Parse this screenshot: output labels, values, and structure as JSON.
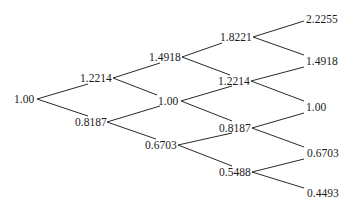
{
  "diagram": {
    "type": "binomial-tree",
    "steps": 4,
    "line_color": "#2a2a2a",
    "text_color": "#1a1a1a",
    "levels": [
      {
        "step": 0,
        "nodes": [
          {
            "id": "n0_0",
            "label": "1.00",
            "x": 14,
            "y": 99,
            "vx": 37
          }
        ]
      },
      {
        "step": 1,
        "nodes": [
          {
            "id": "n1_0",
            "label": "1.2214",
            "x": 80,
            "y": 78,
            "vx": 113
          },
          {
            "id": "n1_1",
            "label": "0.8187",
            "x": 75,
            "y": 122,
            "vx": 107
          }
        ]
      },
      {
        "step": 2,
        "nodes": [
          {
            "id": "n2_0",
            "label": "1.4918",
            "x": 149,
            "y": 57,
            "vx": 182
          },
          {
            "id": "n2_1",
            "label": "1.00",
            "x": 158,
            "y": 101,
            "vx": 181
          },
          {
            "id": "n2_2",
            "label": "0.6703",
            "x": 145,
            "y": 145,
            "vx": 178
          }
        ]
      },
      {
        "step": 3,
        "nodes": [
          {
            "id": "n3_0",
            "label": "1.8221",
            "x": 220,
            "y": 37,
            "vx": 253
          },
          {
            "id": "n3_1",
            "label": "1.2214",
            "x": 218,
            "y": 81,
            "vx": 251
          },
          {
            "id": "n3_2",
            "label": "0.8187",
            "x": 219,
            "y": 128,
            "vx": 252
          },
          {
            "id": "n3_3",
            "label": "0.5488",
            "x": 219,
            "y": 172,
            "vx": 252
          }
        ]
      },
      {
        "step": 4,
        "nodes": [
          {
            "id": "n4_0",
            "label": "2.2255",
            "x": 306,
            "y": 19
          },
          {
            "id": "n4_1",
            "label": "1.4918",
            "x": 306,
            "y": 61
          },
          {
            "id": "n4_2",
            "label": "1.00",
            "x": 306,
            "y": 107
          },
          {
            "id": "n4_3",
            "label": "0.6703",
            "x": 307,
            "y": 153
          },
          {
            "id": "n4_4",
            "label": "0.4493",
            "x": 307,
            "y": 193
          }
        ]
      }
    ],
    "edges": [
      {
        "from": "n0_0",
        "to": "n1_0",
        "x1": 37,
        "y1": 99,
        "x2": 88,
        "y2": 84
      },
      {
        "from": "n0_0",
        "to": "n1_1",
        "x1": 37,
        "y1": 99,
        "x2": 88,
        "y2": 116
      },
      {
        "from": "n1_0",
        "to": "n2_0",
        "x1": 113,
        "y1": 78,
        "x2": 160,
        "y2": 63
      },
      {
        "from": "n1_0",
        "to": "n2_1",
        "x1": 113,
        "y1": 78,
        "x2": 157,
        "y2": 95
      },
      {
        "from": "n1_1",
        "to": "n2_1",
        "x1": 107,
        "y1": 122,
        "x2": 160,
        "y2": 106
      },
      {
        "from": "n1_1",
        "to": "n2_2",
        "x1": 107,
        "y1": 122,
        "x2": 156,
        "y2": 139
      },
      {
        "from": "n2_0",
        "to": "n3_0",
        "x1": 182,
        "y1": 57,
        "x2": 222,
        "y2": 43
      },
      {
        "from": "n2_0",
        "to": "n3_1",
        "x1": 182,
        "y1": 57,
        "x2": 230,
        "y2": 75
      },
      {
        "from": "n2_1",
        "to": "n3_2",
        "x1": 181,
        "y1": 101,
        "x2": 232,
        "y2": 121
      },
      {
        "from": "n2_1",
        "to": "n3_1",
        "x1": 181,
        "y1": 101,
        "x2": 232,
        "y2": 86
      },
      {
        "from": "n2_2",
        "to": "n3_2",
        "x1": 178,
        "y1": 145,
        "x2": 232,
        "y2": 133
      },
      {
        "from": "n2_2",
        "to": "n3_3",
        "x1": 178,
        "y1": 145,
        "x2": 232,
        "y2": 166
      },
      {
        "from": "n3_0",
        "to": "n4_0",
        "x1": 253,
        "y1": 37,
        "x2": 304,
        "y2": 21
      },
      {
        "from": "n3_0",
        "to": "n4_1",
        "x1": 253,
        "y1": 37,
        "x2": 304,
        "y2": 55
      },
      {
        "from": "n3_1",
        "to": "n4_1",
        "x1": 251,
        "y1": 81,
        "x2": 304,
        "y2": 67
      },
      {
        "from": "n3_1",
        "to": "n4_2",
        "x1": 251,
        "y1": 81,
        "x2": 304,
        "y2": 101
      },
      {
        "from": "n3_2",
        "to": "n4_2",
        "x1": 252,
        "y1": 128,
        "x2": 304,
        "y2": 113
      },
      {
        "from": "n3_2",
        "to": "n4_3",
        "x1": 252,
        "y1": 128,
        "x2": 304,
        "y2": 147
      },
      {
        "from": "n3_3",
        "to": "n4_3",
        "x1": 252,
        "y1": 172,
        "x2": 304,
        "y2": 159
      },
      {
        "from": "n3_3",
        "to": "n4_4",
        "x1": 252,
        "y1": 172,
        "x2": 304,
        "y2": 188
      }
    ]
  }
}
